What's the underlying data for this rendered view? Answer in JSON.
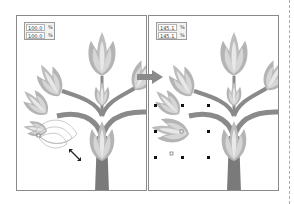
{
  "figure": {
    "before": {
      "scale_x": "100.0",
      "scale_y": "100.0",
      "unit": "%"
    },
    "after": {
      "scale_x": "145.1",
      "scale_y": "145.1",
      "unit": "%"
    }
  },
  "colors": {
    "petal_outer": "#b4b4b4",
    "petal_inner": "#d6d6d6",
    "petal_center": "#e8e8e8",
    "trunk": "#7a7a7a",
    "branch": "#8a8a8a",
    "border": "#8a8a8a"
  }
}
